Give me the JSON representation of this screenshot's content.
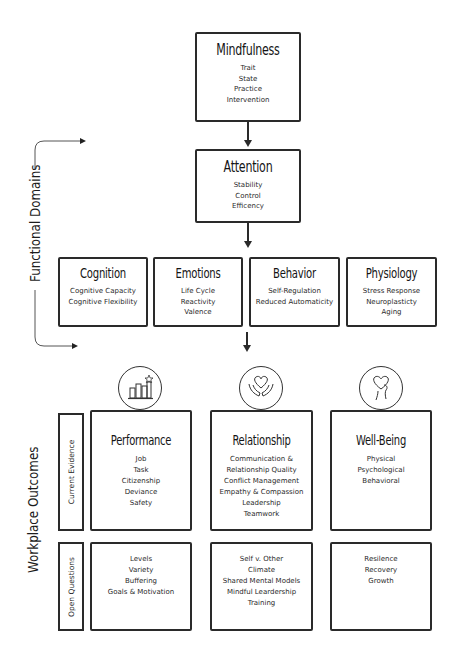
{
  "top": {
    "mindfulness": {
      "title": "Mindfulness",
      "items": [
        "Trait",
        "State",
        "Practice",
        "Intervention"
      ]
    },
    "attention": {
      "title": "Attention",
      "items": [
        "Stability",
        "Control",
        "Efficency"
      ]
    }
  },
  "side_labels": {
    "functional_domains": "Functional Domains",
    "workplace_outcomes": "Workplace Outcomes",
    "current_evidence": "Current Evidence",
    "open_questions": "Open Questions"
  },
  "domains": [
    {
      "title": "Cognition",
      "items": [
        "Cognitive Capacity",
        "Cognitive Flexibility"
      ]
    },
    {
      "title": "Emotions",
      "items": [
        "Life Cycle",
        "Reactivity",
        "Valence"
      ]
    },
    {
      "title": "Behavior",
      "items": [
        "Self-Regulation",
        "Reduced Automaticity"
      ]
    },
    {
      "title": "Physiology",
      "items": [
        "Stress Response",
        "Neuroplasticty",
        "Aging"
      ]
    }
  ],
  "outcomes": [
    {
      "title": "Performance",
      "icon": "bar-chart-star-icon",
      "evidence": [
        "Job",
        "Task",
        "Citizenship",
        "Deviance",
        "Safety"
      ],
      "questions": [
        "Levels",
        "Variety",
        "Buffering",
        "Goals & Motivation"
      ]
    },
    {
      "title": "Relationship",
      "icon": "heart-in-hands-icon",
      "evidence": [
        "Communication &",
        "Relationship Quality",
        "Conflict Management",
        "Empathy & Compassion",
        "Leadership",
        "Teamwork"
      ],
      "questions": [
        "Self v. Other",
        "Climate",
        "Shared Mental Models",
        "Mindful Leardership",
        "Training"
      ]
    },
    {
      "title": "Well-Being",
      "icon": "heart-head-icon",
      "evidence": [
        "Physical",
        "Psychological",
        "Behavioral"
      ],
      "questions": [
        "Resilence",
        "Recovery",
        "Growth"
      ]
    }
  ],
  "colors": {
    "stroke": "#2a2a2a",
    "text": "#1c1c1c",
    "background": "#ffffff"
  }
}
